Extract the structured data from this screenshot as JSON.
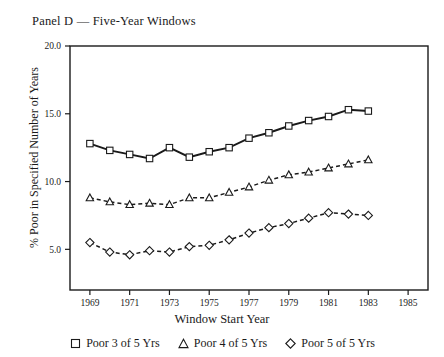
{
  "figure": {
    "panel_title": "Panel D — Five-Year Windows",
    "xlabel": "Window Start Year",
    "ylabel": "% Poor in Specified Number of Years"
  },
  "legend": {
    "items": [
      {
        "marker": "square-marker",
        "label": "Poor 3 of 5 Yrs"
      },
      {
        "marker": "triangle-marker",
        "label": "Poor 4 of 5 Yrs"
      },
      {
        "marker": "diamond-marker",
        "label": "Poor 5 of 5 Yrs"
      }
    ]
  },
  "chart_data": {
    "type": "line",
    "title": "Panel D — Five-Year Windows",
    "xlabel": "Window Start Year",
    "ylabel": "% Poor in Specified Number of Years",
    "xlim": [
      1968,
      1986
    ],
    "ylim": [
      2.0,
      20.0
    ],
    "xticks": [
      1969,
      1971,
      1973,
      1975,
      1977,
      1979,
      1981,
      1983,
      1985
    ],
    "xticklabels": [
      "1969",
      "1971",
      "1973",
      "1975",
      "1977",
      "1979",
      "1981",
      "1983",
      "1985"
    ],
    "yticks": [
      5.0,
      10.0,
      15.0,
      20.0
    ],
    "yticklabels": [
      "5.0",
      "10.0",
      "15.0",
      "20.0"
    ],
    "grid": false,
    "legend_position": "below",
    "x": [
      1969,
      1970,
      1971,
      1972,
      1973,
      1974,
      1975,
      1976,
      1977,
      1978,
      1979,
      1980,
      1981,
      1982,
      1983
    ],
    "series": [
      {
        "name": "Poor 3 of 5 Yrs",
        "marker": "square",
        "linestyle": "solid",
        "values": [
          12.8,
          12.3,
          12.0,
          11.7,
          12.5,
          11.8,
          12.2,
          12.5,
          13.2,
          13.6,
          14.1,
          14.5,
          14.8,
          15.3,
          15.2
        ]
      },
      {
        "name": "Poor 4 of 5 Yrs",
        "marker": "triangle",
        "linestyle": "dashed",
        "values": [
          8.8,
          8.5,
          8.3,
          8.4,
          8.3,
          8.8,
          8.8,
          9.2,
          9.6,
          10.1,
          10.5,
          10.7,
          11.0,
          11.3,
          11.6
        ]
      },
      {
        "name": "Poor 5 of 5 Yrs",
        "marker": "diamond",
        "linestyle": "dashed",
        "values": [
          5.5,
          4.8,
          4.6,
          4.9,
          4.8,
          5.2,
          5.3,
          5.7,
          6.2,
          6.6,
          6.9,
          7.3,
          7.7,
          7.6,
          7.5
        ]
      }
    ]
  }
}
